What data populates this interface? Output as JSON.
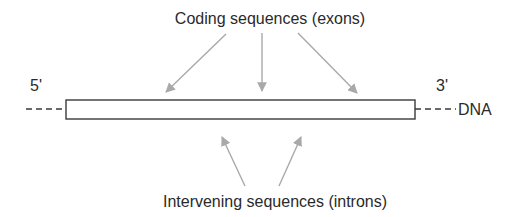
{
  "diagram": {
    "labels": {
      "exons": "Coding sequences (exons)",
      "introns": "Intervening sequences (introns)",
      "five_prime": "5'",
      "three_prime": "3'",
      "dna": "DNA"
    },
    "arrows": {
      "exon_arrow_count": 3,
      "intron_arrow_count": 2
    },
    "colors": {
      "arrow": "#a9a9a9",
      "outline": "#3a3a3a",
      "text": "#2a2a2a",
      "background": "#ffffff"
    }
  }
}
